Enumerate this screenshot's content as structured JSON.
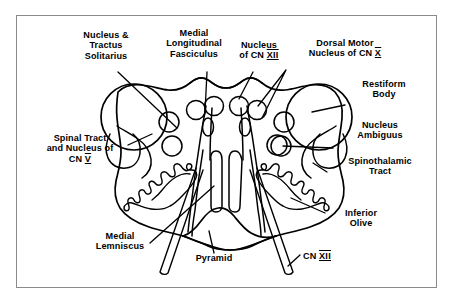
{
  "figure": {
    "border_color": "#8a8a8a",
    "ink_color": "#000000",
    "background": "#ffffff",
    "width": 453,
    "height": 304
  },
  "labels": {
    "nucleus_tractus_solitarius": "Nucleus &\nTractus\nSolitarius",
    "medial_longitudinal_fasciculus": "Medial\nLongitudinal\nFasciculus",
    "nucleus_cn12_top": "Nucleus\nof CN ",
    "nucleus_cn12_top_numeral": "XII",
    "dorsal_motor_nucleus_cn10": "Dorsal Motor\nNucleus of CN ",
    "dorsal_motor_numeral": "X",
    "restiform_body": "Restiform\nBody",
    "nucleus_ambiguus": "Nucleus\nAmbiguus",
    "spinothalamic_tract": "Spinothalamic\nTract",
    "spinal_tract_cn5": "Spinal Tract\nand Nucleus of\nCN ",
    "spinal_tract_numeral": "V",
    "inferior_olive": "Inferior\nOlive",
    "medial_lemniscus": "Medial\nLemniscus",
    "pyramid": "Pyramid",
    "cn12_root": "CN ",
    "cn12_root_numeral": "XII"
  },
  "structures": [
    {
      "name": "medulla-outline",
      "kind": "outline"
    },
    {
      "name": "restiform-body-left",
      "kind": "circle"
    },
    {
      "name": "restiform-body-right",
      "kind": "circle"
    },
    {
      "name": "inferior-olive-left",
      "kind": "crenated-ribbon"
    },
    {
      "name": "inferior-olive-right",
      "kind": "crenated-ribbon"
    },
    {
      "name": "pyramid",
      "kind": "lobe"
    },
    {
      "name": "medial-longitudinal-fasciculus",
      "kind": "paired-columns"
    },
    {
      "name": "hypoglossal-nucleus-left",
      "kind": "circle"
    },
    {
      "name": "hypoglossal-nucleus-right",
      "kind": "circle"
    },
    {
      "name": "dorsal-motor-nucleus-left",
      "kind": "circle"
    },
    {
      "name": "dorsal-motor-nucleus-right",
      "kind": "circle"
    },
    {
      "name": "solitary-nucleus-left",
      "kind": "circle"
    },
    {
      "name": "solitary-nucleus-right",
      "kind": "circle"
    },
    {
      "name": "nucleus-ambiguus-left",
      "kind": "circle"
    },
    {
      "name": "nucleus-ambiguus-right",
      "kind": "circle"
    },
    {
      "name": "spinal-trigeminal-nucleus-left",
      "kind": "circle"
    },
    {
      "name": "spinal-trigeminal-nucleus-right",
      "kind": "circle"
    },
    {
      "name": "cn12-rootlets-left",
      "kind": "nerve-strip"
    },
    {
      "name": "cn12-rootlets-right",
      "kind": "nerve-strip"
    }
  ]
}
